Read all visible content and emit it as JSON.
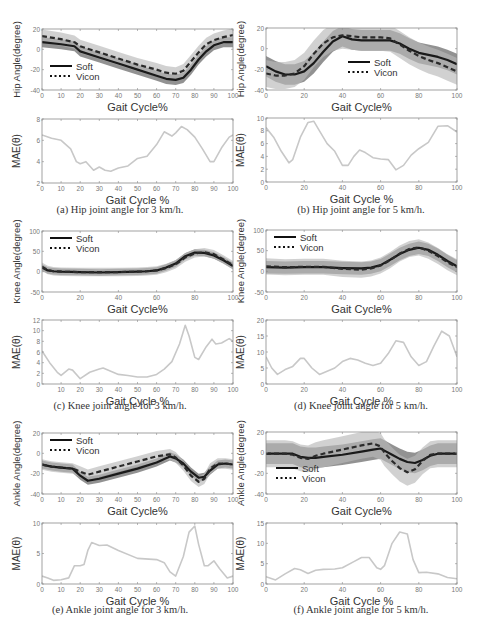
{
  "chart_data": [
    {
      "id": "hip3-angle",
      "type": "line",
      "title": "",
      "xlabel": "Gait Cycle%",
      "ylabel": "Hip Angle(degree)",
      "xlim": [
        0,
        100
      ],
      "ylim": [
        -40,
        20
      ],
      "xticks": [
        0,
        10,
        20,
        30,
        40,
        50,
        60,
        70,
        80,
        90,
        100
      ],
      "yticks": [
        -40,
        -20,
        0,
        20
      ],
      "legend": {
        "position": "lower-left",
        "entries": [
          "Soft",
          "Vicon"
        ]
      },
      "x": [
        0,
        10,
        17,
        20,
        30,
        40,
        50,
        60,
        65,
        70,
        74,
        78,
        82,
        86,
        90,
        95,
        100
      ],
      "series": [
        {
          "name": "Soft",
          "style": "solid",
          "values": [
            7,
            5,
            3,
            -2,
            -8,
            -14,
            -20,
            -26,
            -29,
            -30,
            -28,
            -20,
            -10,
            -2,
            4,
            7,
            7
          ]
        },
        {
          "name": "Vicon",
          "style": "dashed",
          "values": [
            13,
            10,
            7,
            3,
            -3,
            -9,
            -15,
            -20,
            -23,
            -24,
            -21,
            -12,
            -3,
            5,
            9,
            12,
            14
          ]
        }
      ],
      "band_width": 5
    },
    {
      "id": "hip5-angle",
      "type": "line",
      "title": "",
      "xlabel": "Gait Cycle%",
      "ylabel": "Hip Angle(degree)",
      "xlim": [
        0,
        100
      ],
      "ylim": [
        -40,
        20
      ],
      "xticks": [
        0,
        20,
        40,
        60,
        80,
        100
      ],
      "yticks": [
        -40,
        -20,
        0,
        20
      ],
      "legend": {
        "position": "center",
        "entries": [
          "Soft",
          "Vicon"
        ]
      },
      "x": [
        0,
        5,
        10,
        15,
        20,
        25,
        30,
        35,
        40,
        45,
        50,
        60,
        65,
        70,
        75,
        80,
        85,
        90,
        95,
        100
      ],
      "series": [
        {
          "name": "Soft",
          "style": "solid",
          "values": [
            -17,
            -22,
            -25,
            -25,
            -22,
            -14,
            -3,
            7,
            12,
            9,
            8,
            8,
            8,
            5,
            0,
            -4,
            -6,
            -8,
            -11,
            -15
          ]
        },
        {
          "name": "Vicon",
          "style": "dashed",
          "values": [
            -24,
            -26,
            -26,
            -24,
            -17,
            -5,
            5,
            11,
            13,
            12,
            11,
            11,
            10,
            4,
            -2,
            -7,
            -11,
            -14,
            -18,
            -22
          ]
        }
      ],
      "band_width": 10
    },
    {
      "id": "hip3-mae",
      "type": "line",
      "title": "",
      "xlabel": "Gait Cycle %",
      "ylabel": "MAE(θ)",
      "xlim": [
        0,
        100
      ],
      "ylim": [
        2,
        8
      ],
      "xticks": [
        0,
        10,
        20,
        30,
        40,
        50,
        60,
        70,
        80,
        90,
        100
      ],
      "yticks": [
        2,
        4,
        6,
        8
      ],
      "x": [
        0,
        5,
        10,
        15,
        18,
        20,
        23,
        27,
        30,
        33,
        36,
        40,
        45,
        50,
        55,
        60,
        64,
        68,
        70,
        73,
        76,
        80,
        84,
        88,
        90,
        94,
        98,
        100
      ],
      "series": [
        {
          "name": "MAE",
          "style": "solid",
          "values": [
            6.5,
            6.2,
            6.0,
            5.2,
            4.0,
            3.8,
            4.0,
            3.2,
            3.5,
            3.2,
            3.1,
            3.4,
            3.6,
            4.3,
            4.5,
            5.6,
            6.8,
            6.4,
            6.7,
            7.3,
            7.0,
            6.3,
            5.2,
            4.0,
            4.0,
            5.3,
            6.3,
            6.5
          ]
        }
      ]
    },
    {
      "id": "hip5-mae",
      "type": "line",
      "title": "",
      "xlabel": "Gait Cycle %",
      "ylabel": "MAE(θ)",
      "xlim": [
        0,
        100
      ],
      "ylim": [
        0,
        10
      ],
      "xticks": [
        0,
        20,
        40,
        60,
        80,
        100
      ],
      "yticks": [
        0,
        2,
        4,
        6,
        8,
        10
      ],
      "x": [
        0,
        4,
        8,
        12,
        14,
        18,
        22,
        25,
        28,
        32,
        36,
        40,
        43,
        46,
        49,
        52,
        56,
        60,
        64,
        68,
        72,
        76,
        80,
        85,
        90,
        95,
        100
      ],
      "series": [
        {
          "name": "MAE",
          "style": "solid",
          "values": [
            8.5,
            7.0,
            4.8,
            3.0,
            3.5,
            7.0,
            9.3,
            9.5,
            8.0,
            6.0,
            4.8,
            2.6,
            2.6,
            4.0,
            5.0,
            4.6,
            3.8,
            3.6,
            3.5,
            1.9,
            2.6,
            4.2,
            5.2,
            6.2,
            8.7,
            8.8,
            7.8
          ]
        }
      ]
    },
    {
      "id": "knee3-angle",
      "type": "line",
      "title": "",
      "xlabel": "Gait Cycle%",
      "ylabel": "Knee Angle(degree)",
      "xlim": [
        0,
        100
      ],
      "ylim": [
        -50,
        100
      ],
      "xticks": [
        0,
        20,
        40,
        60,
        80,
        100
      ],
      "yticks": [
        -50,
        0,
        50,
        100
      ],
      "legend": {
        "position": "upper-left",
        "entries": [
          "Soft",
          "Vicon"
        ]
      },
      "x": [
        0,
        3,
        6,
        10,
        20,
        30,
        40,
        50,
        55,
        60,
        65,
        70,
        75,
        80,
        85,
        90,
        95,
        100
      ],
      "series": [
        {
          "name": "Soft",
          "style": "solid",
          "values": [
            10,
            3,
            1,
            0,
            -1,
            -2,
            -1,
            0,
            1,
            3,
            10,
            20,
            38,
            47,
            46,
            40,
            28,
            14
          ]
        },
        {
          "name": "Vicon",
          "style": "dashed",
          "values": [
            12,
            4,
            1,
            0,
            -1,
            -1,
            -1,
            0,
            1,
            3,
            9,
            18,
            35,
            45,
            48,
            43,
            30,
            16
          ]
        }
      ],
      "band_width": 8
    },
    {
      "id": "knee5-angle",
      "type": "line",
      "title": "",
      "xlabel": "Gait Cycle%",
      "ylabel": "Knee Angle(degree)",
      "xlim": [
        0,
        100
      ],
      "ylim": [
        -50,
        100
      ],
      "xticks": [
        0,
        20,
        40,
        60,
        80,
        100
      ],
      "yticks": [
        -50,
        0,
        50,
        100
      ],
      "legend": {
        "position": "upper-left",
        "entries": [
          "Soft",
          "Vicon"
        ]
      },
      "x": [
        0,
        10,
        20,
        30,
        40,
        50,
        55,
        60,
        65,
        70,
        75,
        80,
        85,
        90,
        95,
        100
      ],
      "series": [
        {
          "name": "Soft",
          "style": "solid",
          "values": [
            10,
            9,
            10,
            10,
            8,
            7,
            9,
            15,
            28,
            42,
            52,
            57,
            52,
            40,
            25,
            12
          ]
        },
        {
          "name": "Vicon",
          "style": "dashed",
          "values": [
            12,
            10,
            11,
            11,
            6,
            4,
            7,
            14,
            27,
            43,
            54,
            58,
            50,
            37,
            22,
            10
          ]
        }
      ],
      "band_width": 15
    },
    {
      "id": "knee3-mae",
      "type": "line",
      "title": "",
      "xlabel": "Gait Cycle %",
      "ylabel": "MAE(θ)",
      "xlim": [
        0,
        100
      ],
      "ylim": [
        0,
        12
      ],
      "xticks": [
        10,
        20,
        30,
        40,
        50,
        60,
        70,
        80,
        90,
        100
      ],
      "yticks": [
        0,
        2,
        4,
        6,
        8,
        10,
        12
      ],
      "x": [
        0,
        4,
        8,
        10,
        14,
        16,
        20,
        25,
        30,
        32,
        36,
        40,
        45,
        50,
        55,
        60,
        64,
        68,
        72,
        75,
        77,
        80,
        82,
        86,
        89,
        91,
        94,
        98,
        100
      ],
      "series": [
        {
          "name": "MAE",
          "style": "solid",
          "values": [
            6.2,
            4.0,
            2.2,
            1.6,
            2.8,
            2.6,
            1.0,
            2.2,
            2.8,
            3.0,
            2.4,
            1.8,
            1.6,
            1.3,
            1.3,
            1.8,
            2.8,
            4.2,
            7.5,
            11.0,
            9.0,
            5.0,
            4.6,
            7.0,
            8.4,
            7.5,
            7.7,
            8.5,
            8.0
          ]
        }
      ]
    },
    {
      "id": "knee5-mae",
      "type": "line",
      "title": "",
      "xlabel": "Gait Cycle %",
      "ylabel": "MAE(θ)",
      "xlim": [
        0,
        100
      ],
      "ylim": [
        0,
        20
      ],
      "xticks": [
        0,
        20,
        40,
        60,
        80,
        100
      ],
      "yticks": [
        0,
        5,
        10,
        15,
        20
      ],
      "x": [
        0,
        3,
        6,
        10,
        14,
        18,
        20,
        24,
        28,
        32,
        36,
        40,
        44,
        48,
        52,
        56,
        60,
        64,
        68,
        72,
        76,
        80,
        84,
        88,
        92,
        96,
        100
      ],
      "series": [
        {
          "name": "MAE",
          "style": "solid",
          "values": [
            8.5,
            5.0,
            3.0,
            4.5,
            5.5,
            8.0,
            8.0,
            5.0,
            3.0,
            4.0,
            5.0,
            7.0,
            8.0,
            7.5,
            6.5,
            5.8,
            6.5,
            9.5,
            13.5,
            13.0,
            8.5,
            5.8,
            7.0,
            12.0,
            16.5,
            15.0,
            8.5
          ]
        }
      ]
    },
    {
      "id": "ankle3-angle",
      "type": "line",
      "title": "",
      "xlabel": "Gait Cycle%",
      "ylabel": "Ankle Angle(degree)",
      "xlim": [
        0,
        100
      ],
      "ylim": [
        -40,
        20
      ],
      "xticks": [
        0,
        10,
        20,
        30,
        40,
        50,
        60,
        70,
        80,
        90,
        100
      ],
      "yticks": [
        -40,
        -20,
        0,
        20
      ],
      "legend": {
        "position": "upper-left",
        "entries": [
          "Soft",
          "Vicon"
        ]
      },
      "x": [
        0,
        5,
        10,
        16,
        20,
        24,
        30,
        40,
        50,
        60,
        67,
        70,
        74,
        78,
        82,
        85,
        88,
        92,
        96,
        100
      ],
      "series": [
        {
          "name": "Soft",
          "style": "solid",
          "values": [
            -11,
            -13,
            -14,
            -15,
            -22,
            -27,
            -25,
            -20,
            -15,
            -9,
            -3,
            -5,
            -10,
            -18,
            -24,
            -23,
            -17,
            -11,
            -10,
            -11
          ]
        },
        {
          "name": "Vicon",
          "style": "dashed",
          "values": [
            -11,
            -13,
            -14,
            -15,
            -18,
            -21,
            -18,
            -13,
            -8,
            -3,
            -1,
            -4,
            -12,
            -22,
            -28,
            -25,
            -15,
            -10,
            -10,
            -11
          ]
        }
      ],
      "band_width": 4
    },
    {
      "id": "ankle5-angle",
      "type": "line",
      "title": "",
      "xlabel": "Gait Cycle%",
      "ylabel": "Ankle Angle(degree)",
      "xlim": [
        0,
        100
      ],
      "ylim": [
        -40,
        20
      ],
      "xticks": [
        0,
        20,
        40,
        60,
        80,
        100
      ],
      "yticks": [
        -40,
        -20,
        0,
        20
      ],
      "legend": {
        "position": "lower-left",
        "entries": [
          "Soft",
          "Vicon"
        ]
      },
      "x": [
        0,
        10,
        14,
        18,
        22,
        26,
        30,
        40,
        50,
        56,
        60,
        62,
        66,
        70,
        74,
        78,
        82,
        86,
        90,
        95,
        100
      ],
      "series": [
        {
          "name": "Soft",
          "style": "solid",
          "values": [
            -1,
            -1,
            -1,
            -4,
            -5,
            -5,
            -4,
            -2,
            1,
            3,
            4,
            2,
            -2,
            -6,
            -9,
            -10,
            -7,
            -3,
            -1,
            -1,
            -1
          ]
        },
        {
          "name": "Vicon",
          "style": "dashed",
          "values": [
            -1,
            -1,
            -2,
            -5,
            -6,
            -3,
            -1,
            3,
            7,
            9,
            6,
            0,
            -8,
            -15,
            -19,
            -16,
            -8,
            -2,
            -1,
            -1,
            -1
          ]
        }
      ],
      "band_width": 10
    },
    {
      "id": "ankle3-mae",
      "type": "line",
      "title": "",
      "xlabel": "Gait Cycle %",
      "ylabel": "MAE(θ)",
      "xlim": [
        0,
        100
      ],
      "ylim": [
        0,
        10
      ],
      "xticks": [
        0,
        10,
        20,
        30,
        40,
        50,
        60,
        70,
        80,
        90,
        100
      ],
      "yticks": [
        0,
        5,
        10
      ],
      "x": [
        0,
        3,
        6,
        10,
        14,
        17,
        18,
        20,
        22,
        24,
        26,
        30,
        34,
        40,
        50,
        60,
        64,
        67,
        70,
        74,
        77,
        80,
        82,
        85,
        87,
        90,
        93,
        97,
        100
      ],
      "series": [
        {
          "name": "MAE",
          "style": "solid",
          "values": [
            1.3,
            1.0,
            0.6,
            0.7,
            1.0,
            3.0,
            3.0,
            3.0,
            3.2,
            5.5,
            6.8,
            6.3,
            6.4,
            5.5,
            4.2,
            4.0,
            3.5,
            2.0,
            1.3,
            4.5,
            8.5,
            9.5,
            6.5,
            3.0,
            3.0,
            3.8,
            2.5,
            1.0,
            1.3
          ]
        }
      ]
    },
    {
      "id": "ankle5-mae",
      "type": "line",
      "title": "",
      "xlabel": "Gait Cycle %",
      "ylabel": "MAE(θ)",
      "xlim": [
        0,
        100
      ],
      "ylim": [
        0,
        15
      ],
      "xticks": [
        0,
        20,
        40,
        60,
        80,
        100
      ],
      "yticks": [
        0,
        5,
        10,
        15
      ],
      "x": [
        0,
        5,
        10,
        15,
        18,
        22,
        26,
        30,
        36,
        40,
        46,
        50,
        54,
        58,
        60,
        62,
        66,
        70,
        74,
        77,
        80,
        84,
        90,
        95,
        100
      ],
      "series": [
        {
          "name": "MAE",
          "style": "solid",
          "values": [
            1.8,
            1.0,
            2.5,
            3.8,
            3.5,
            2.6,
            3.4,
            3.6,
            3.7,
            4.0,
            5.5,
            6.5,
            6.5,
            4.0,
            3.6,
            4.5,
            10.0,
            12.8,
            12.3,
            6.0,
            2.8,
            2.9,
            2.5,
            1.6,
            1.3
          ]
        }
      ]
    }
  ],
  "captions": [
    "(a) Hip joint angle for 3 km/h.",
    "(b) Hip joint angle for 5 km/h.",
    "(c) Knee joint angle for 3 km/h.",
    "(d) Knee joint angle for 5 km/h.",
    "(e) Ankle joint angle for 3 km/h.",
    "(f) Ankle joint angle for 5 km/h."
  ],
  "colors": {
    "soft_line": "#1a1a1a",
    "vicon_line": "#2a2a2a",
    "band_dark": "#6e6e6e",
    "band_light": "#b8b8b8",
    "mae_line": "#c8c8c8",
    "axis": "#8a8a8a",
    "tick_text": "#777777",
    "label_text": "#333333"
  }
}
